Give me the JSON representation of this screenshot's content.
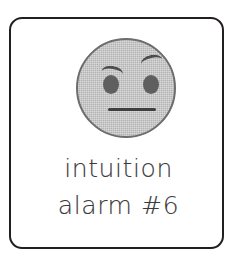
{
  "card": {
    "border_color": "#231f20",
    "background_color": "#ffffff"
  },
  "illustration": {
    "name": "skeptical-face",
    "fill_color": "#b2b2b2",
    "outline_color": "#6d6d6d",
    "eye_color": "#5f5f5f",
    "brow_color": "#4d4d4d",
    "mouth_color": "#3f3f3f",
    "features": {
      "left_eye": "oval-eye",
      "right_eye": "oval-eye",
      "left_eyebrow": "lowered-eyebrow",
      "right_eyebrow": "raised-eyebrow",
      "mouth": "straight-line-mouth"
    }
  },
  "caption": {
    "color": "#3c3a3b",
    "line1": "intuition",
    "line2": "alarm #6"
  }
}
